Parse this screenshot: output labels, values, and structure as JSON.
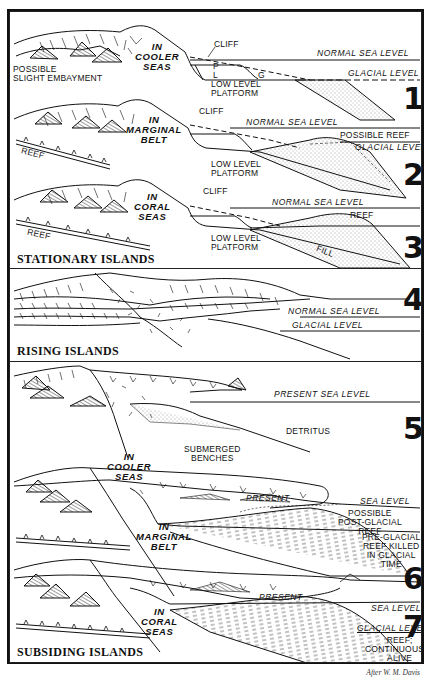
{
  "figure": {
    "credit": "After W. M. Davis",
    "groups": [
      {
        "title": "STATIONARY ISLANDS"
      },
      {
        "title": "RISING ISLANDS"
      },
      {
        "title": "SUBSIDING ISLANDS"
      }
    ],
    "panels": [
      {
        "number": "1",
        "setting": [
          "IN",
          "COOLER",
          "SEAS"
        ],
        "labels": {
          "embayment": [
            "POSSIBLE",
            "SLIGHT EMBAYMENT"
          ],
          "cliff": "CLIFF",
          "p": "P",
          "l": "L",
          "g": "G",
          "platform": [
            "LOW LEVEL",
            "PLATFORM"
          ],
          "normal_sea_level": "NORMAL SEA LEVEL",
          "glacial_level": "GLACIAL LEVEL"
        }
      },
      {
        "number": "2",
        "setting": [
          "IN",
          "MARGINAL",
          "BELT"
        ],
        "labels": {
          "reef": "REEF",
          "cliff": "CLIFF",
          "platform": [
            "LOW LEVEL",
            "PLATFORM"
          ],
          "normal_sea_level": "NORMAL SEA LEVEL",
          "possible_reef": "POSSIBLE REEF",
          "glacial_level": "GLACIAL LEVEL"
        }
      },
      {
        "number": "3",
        "setting": [
          "IN",
          "CORAL",
          "SEAS"
        ],
        "labels": {
          "reef_left": "REEF",
          "cliff": "CLIFF",
          "platform": [
            "LOW LEVEL",
            "PLATFORM"
          ],
          "normal_sea_level": "NORMAL SEA LEVEL",
          "reef": "REEF",
          "fill": "FILL"
        }
      },
      {
        "number": "4",
        "labels": {
          "normal_sea_level": "NORMAL SEA LEVEL",
          "glacial_level": "GLACIAL LEVEL"
        }
      },
      {
        "number": "5",
        "setting": [
          "IN",
          "COOLER",
          "SEAS"
        ],
        "labels": {
          "present_sea_level": "PRESENT SEA LEVEL",
          "detritus": "DETRITUS",
          "benches": [
            "SUBMERGED",
            "BENCHES"
          ]
        }
      },
      {
        "number": "6",
        "setting": [
          "IN",
          "MARGINAL",
          "BELT"
        ],
        "labels": {
          "present": "PRESENT",
          "sea_level": "SEA LEVEL",
          "post_glacial": [
            "POSSIBLE",
            "POST-GLACIAL",
            "REEF"
          ],
          "pre_glacial": [
            "PRE-GLACIAL",
            "REEF KILLED",
            "IN GLACIAL",
            "TIME"
          ]
        }
      },
      {
        "number": "7",
        "setting": [
          "IN",
          "CORAL",
          "SEAS"
        ],
        "labels": {
          "present": "PRESENT",
          "sea_level": "SEA LEVEL",
          "glacial_level": "GLACIAL LEVEL",
          "reef_alive": [
            "REEF;",
            "CONTINUOUSLY",
            "ALIVE"
          ]
        }
      }
    ]
  }
}
